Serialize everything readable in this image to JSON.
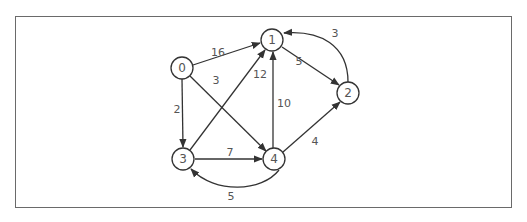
{
  "diagram": {
    "type": "directed-weighted-graph",
    "nodes": [
      {
        "id": "0",
        "label": "0",
        "x": 182,
        "y": 68
      },
      {
        "id": "1",
        "label": "1",
        "x": 272,
        "y": 40
      },
      {
        "id": "2",
        "label": "2",
        "x": 348,
        "y": 93
      },
      {
        "id": "3",
        "label": "3",
        "x": 183,
        "y": 159
      },
      {
        "id": "4",
        "label": "4",
        "x": 274,
        "y": 159
      }
    ],
    "edges": [
      {
        "from": "0",
        "to": "1",
        "weight": "16"
      },
      {
        "from": "0",
        "to": "4",
        "weight": "3"
      },
      {
        "from": "0",
        "to": "3",
        "weight": "2"
      },
      {
        "from": "1",
        "to": "2",
        "weight": "5"
      },
      {
        "from": "2",
        "to": "1",
        "weight": "3"
      },
      {
        "from": "3",
        "to": "1",
        "weight": "12"
      },
      {
        "from": "3",
        "to": "4",
        "weight": "7"
      },
      {
        "from": "4",
        "to": "1",
        "weight": "10"
      },
      {
        "from": "4",
        "to": "2",
        "weight": "4"
      },
      {
        "from": "4",
        "to": "3",
        "weight": "5"
      }
    ]
  }
}
